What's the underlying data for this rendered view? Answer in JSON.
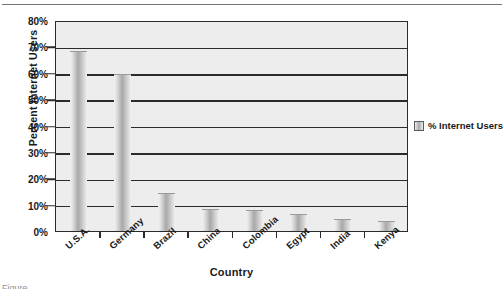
{
  "chart_data": {
    "type": "bar",
    "title": "",
    "xlabel": "Country",
    "ylabel": "Percent Internet Users",
    "categories": [
      "U.S.A.",
      "Germany",
      "Brazil",
      "China",
      "Colombia",
      "Egypt",
      "India",
      "Kenya"
    ],
    "values": [
      68,
      59,
      14,
      8,
      7.5,
      6,
      4,
      3.5
    ],
    "series": [
      {
        "name": "% Internet Users",
        "values": [
          68,
          59,
          14,
          8,
          7.5,
          6,
          4,
          3.5
        ]
      }
    ],
    "ylim": [
      0,
      80
    ],
    "ytick_values": [
      0,
      10,
      20,
      30,
      40,
      50,
      60,
      70,
      80
    ],
    "ytick_labels": [
      "0%",
      "10%",
      "20%",
      "30%",
      "40%",
      "50%",
      "60%",
      "70%",
      "80%"
    ],
    "grid": true,
    "legend": {
      "position": "right",
      "entries": [
        "% Internet Users"
      ]
    },
    "colors": {
      "plot_background": "#ededed",
      "axis": "#2b2b2b",
      "bar_fill": "#a8a8a8",
      "text": "#1a1a1a"
    }
  },
  "caption": "Figure ..."
}
